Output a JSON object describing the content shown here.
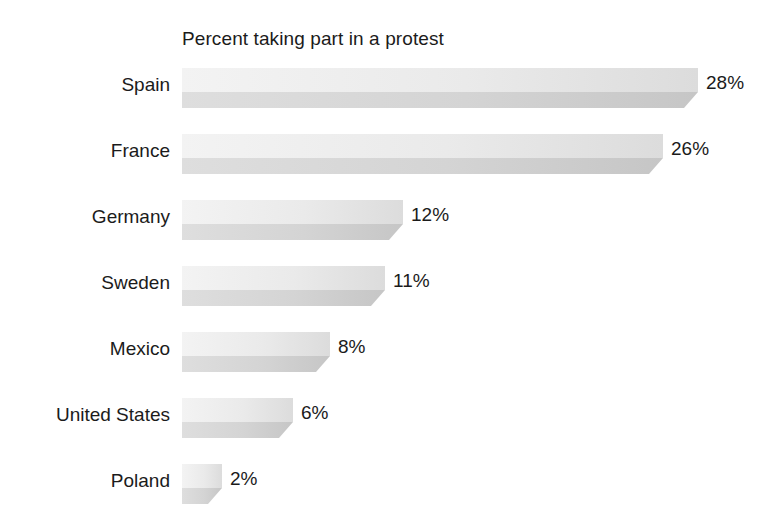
{
  "chart_data": {
    "type": "bar",
    "orientation": "horizontal",
    "title": "Percent taking part in a protest",
    "xlabel": "",
    "ylabel": "",
    "categories": [
      "Spain",
      "France",
      "Germany",
      "Sweden",
      "Mexico",
      "United States",
      "Poland"
    ],
    "values": [
      28,
      26,
      12,
      11,
      8,
      6,
      2
    ],
    "value_labels": [
      "28%",
      "26%",
      "12%",
      "11%",
      "8%",
      "6%",
      "2%"
    ],
    "xlim": [
      0,
      28
    ],
    "grid": false,
    "legend": false,
    "style": "3d-extruded-grayscale",
    "colors": {
      "background": "#ffffff",
      "text": "#1b1b1b",
      "bar_top_face_light": "#f3f3f3",
      "bar_top_face_dark": "#dcdcdc",
      "bar_front_face_light": "#dedede",
      "bar_front_face_dark": "#c6c6c6",
      "bar_bevel": "#cfcfcf"
    },
    "bars": [
      {
        "category": "Spain",
        "value": 28,
        "label": "28%",
        "px_length": 516
      },
      {
        "category": "France",
        "value": 26,
        "label": "26%",
        "px_length": 481
      },
      {
        "category": "Germany",
        "value": 12,
        "label": "12%",
        "px_length": 221
      },
      {
        "category": "Sweden",
        "value": 11,
        "label": "11%",
        "px_length": 203
      },
      {
        "category": "Mexico",
        "value": 8,
        "label": "8%",
        "px_length": 148
      },
      {
        "category": "United States",
        "value": 6,
        "label": "6%",
        "px_length": 111
      },
      {
        "category": "Poland",
        "value": 2,
        "label": "2%",
        "px_length": 40
      }
    ]
  }
}
